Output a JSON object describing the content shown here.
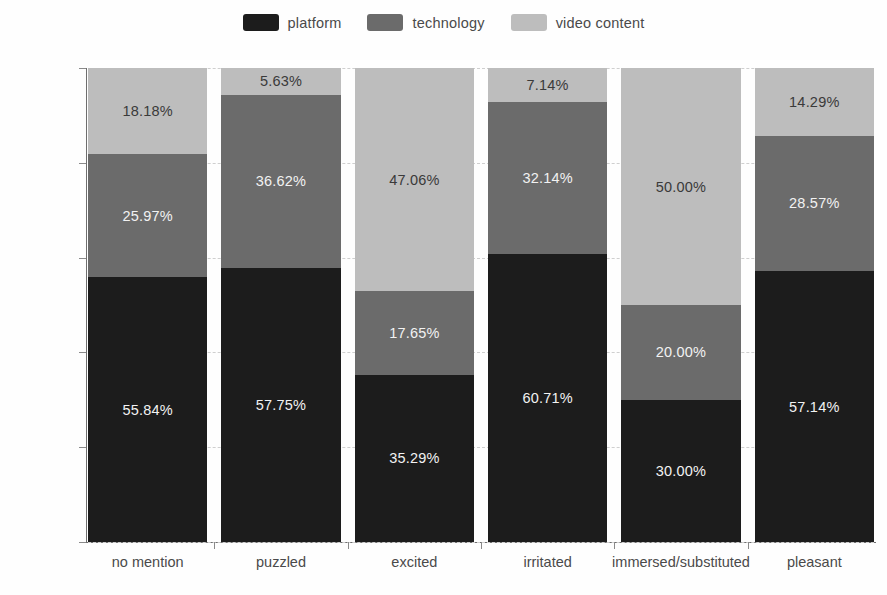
{
  "chart_data": {
    "type": "bar",
    "subtype": "stacked-percentage",
    "title": "",
    "subtitle": "",
    "xlabel": "",
    "ylabel": "",
    "ylim": [
      0,
      100
    ],
    "grid": true,
    "legend_position": "top-center",
    "categories": [
      "no mention",
      "puzzled",
      "excited",
      "irritated",
      "immersed/substituted",
      "pleasant"
    ],
    "ytick_labels": [
      "0%",
      "20%",
      "40%",
      "60%",
      "80%",
      "100%"
    ],
    "ytick_values": [
      0,
      20,
      40,
      60,
      80,
      100
    ],
    "series": [
      {
        "name": "platform",
        "color": "#1c1c1c",
        "values": [
          55.84,
          57.75,
          35.29,
          60.71,
          30.0,
          57.14
        ],
        "labels": [
          "55.84%",
          "57.75%",
          "35.29%",
          "60.71%",
          "30.00%",
          "57.14%"
        ]
      },
      {
        "name": "technology",
        "color": "#6b6b6b",
        "values": [
          25.97,
          36.62,
          17.65,
          32.14,
          20.0,
          28.57
        ],
        "labels": [
          "25.97%",
          "36.62%",
          "17.65%",
          "32.14%",
          "20.00%",
          "28.57%"
        ]
      },
      {
        "name": "video content",
        "color": "#bdbdbd",
        "values": [
          18.18,
          5.63,
          47.06,
          7.14,
          50.0,
          14.29
        ],
        "labels": [
          "18.18%",
          "5.63%",
          "47.06%",
          "7.14%",
          "50.00%",
          "14.29%"
        ]
      }
    ]
  },
  "legend": {
    "items": [
      {
        "label": "platform",
        "color": "#1c1c1c"
      },
      {
        "label": "technology",
        "color": "#6b6b6b"
      },
      {
        "label": "video content",
        "color": "#bdbdbd"
      }
    ]
  },
  "axes": {
    "y": {
      "ticks": [
        {
          "label": "100%",
          "value": 100
        },
        {
          "label": "80%",
          "value": 80
        },
        {
          "label": "60%",
          "value": 60
        },
        {
          "label": "40%",
          "value": 40
        },
        {
          "label": "20%",
          "value": 20
        },
        {
          "label": "0%",
          "value": 0
        }
      ]
    },
    "x": {
      "ticks": [
        {
          "label": "no mention"
        },
        {
          "label": "puzzled"
        },
        {
          "label": "excited"
        },
        {
          "label": "irritated"
        },
        {
          "label": "immersed/substituted"
        },
        {
          "label": "pleasant"
        }
      ]
    }
  },
  "colors": {
    "platform": "#1c1c1c",
    "technology": "#6b6b6b",
    "video_content": "#bdbdbd",
    "gridline": "#cfcfcf",
    "axis": "#6e6e6e",
    "background": "#fefefe"
  }
}
